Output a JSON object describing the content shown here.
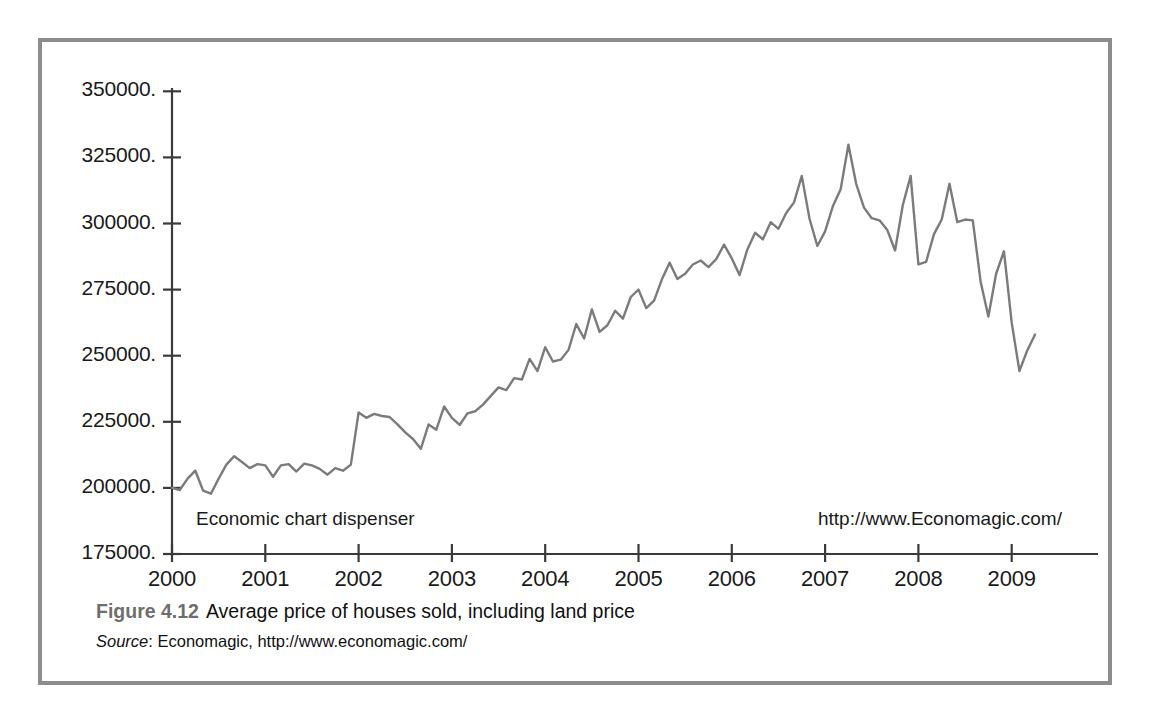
{
  "figure": {
    "caption_figure_number": "Figure 4.12",
    "caption_title": "Average price of houses sold, including land price",
    "source_label": "Source",
    "source_text": ": Economagic, http://www.economagic.com/"
  },
  "annotations": {
    "left": "Economic chart dispenser",
    "right": "http://www.Economagic.com/"
  },
  "colors": {
    "line": "#7b7b7b",
    "axis": "#3a3a3a",
    "frame": "#8d8d8d",
    "text": "#1a1a1a",
    "caption_number": "#6e6e6e"
  },
  "chart_data": {
    "type": "line",
    "title": "Average price of houses sold, including land price",
    "xlabel": "",
    "ylabel": "",
    "xlim": [
      2000.0,
      2009.75
    ],
    "ylim": [
      175000,
      350000
    ],
    "grid": false,
    "legend": "none",
    "x_tick_labels": [
      "2000",
      "2001",
      "2002",
      "2003",
      "2004",
      "2005",
      "2006",
      "2007",
      "2008",
      "2009"
    ],
    "x_tick_values": [
      2000,
      2001,
      2002,
      2003,
      2004,
      2005,
      2006,
      2007,
      2008,
      2009
    ],
    "y_tick_labels": [
      "175000.",
      "200000.",
      "225000.",
      "250000.",
      "275000.",
      "300000.",
      "325000.",
      "350000."
    ],
    "y_tick_values": [
      175000,
      200000,
      225000,
      250000,
      275000,
      300000,
      325000,
      350000
    ],
    "series": [
      {
        "name": "Average price of houses sold",
        "x": [
          2000.0,
          2000.083,
          2000.167,
          2000.25,
          2000.333,
          2000.417,
          2000.5,
          2000.583,
          2000.667,
          2000.75,
          2000.833,
          2000.917,
          2001.0,
          2001.083,
          2001.167,
          2001.25,
          2001.333,
          2001.417,
          2001.5,
          2001.583,
          2001.667,
          2001.75,
          2001.833,
          2001.917,
          2002.0,
          2002.083,
          2002.167,
          2002.25,
          2002.333,
          2002.417,
          2002.5,
          2002.583,
          2002.667,
          2002.75,
          2002.833,
          2002.917,
          2003.0,
          2003.083,
          2003.167,
          2003.25,
          2003.333,
          2003.417,
          2003.5,
          2003.583,
          2003.667,
          2003.75,
          2003.833,
          2003.917,
          2004.0,
          2004.083,
          2004.167,
          2004.25,
          2004.333,
          2004.417,
          2004.5,
          2004.583,
          2004.667,
          2004.75,
          2004.833,
          2004.917,
          2005.0,
          2005.083,
          2005.167,
          2005.25,
          2005.333,
          2005.417,
          2005.5,
          2005.583,
          2005.667,
          2005.75,
          2005.833,
          2005.917,
          2006.0,
          2006.083,
          2006.167,
          2006.25,
          2006.333,
          2006.417,
          2006.5,
          2006.583,
          2006.667,
          2006.75,
          2006.833,
          2006.917,
          2007.0,
          2007.083,
          2007.167,
          2007.25,
          2007.333,
          2007.417,
          2007.5,
          2007.583,
          2007.667,
          2007.75,
          2007.833,
          2007.917,
          2008.0,
          2008.083,
          2008.167,
          2008.25,
          2008.333,
          2008.417,
          2008.5,
          2008.583,
          2008.667,
          2008.75,
          2008.833,
          2008.917,
          2009.0,
          2009.083,
          2009.167,
          2009.25
        ],
        "y": [
          200000,
          199200,
          203500,
          206500,
          199000,
          197800,
          203500,
          208800,
          212000,
          209800,
          207500,
          209000,
          208500,
          204200,
          208500,
          209000,
          206200,
          209200,
          208500,
          207200,
          205000,
          207500,
          206500,
          208800,
          228500,
          226500,
          228000,
          227200,
          226800,
          224000,
          221000,
          218500,
          214800,
          224000,
          222000,
          230800,
          226500,
          223800,
          228200,
          229000,
          231500,
          234800,
          238000,
          237000,
          241500,
          241000,
          248800,
          244200,
          253200,
          247800,
          248500,
          252200,
          262000,
          256500,
          267500,
          259000,
          261500,
          267000,
          264000,
          272200,
          275000,
          268000,
          270800,
          278800,
          285200,
          279000,
          281000,
          284500,
          286000,
          283500,
          286500,
          292000,
          286800,
          280500,
          290200,
          296500,
          294000,
          300500,
          298000,
          304000,
          308000,
          318000,
          301800,
          291500,
          297000,
          306500,
          313000,
          329800,
          315000,
          306000,
          302000,
          301200,
          297500,
          289800,
          307000,
          318000,
          284500,
          285500,
          296000,
          301500,
          315000,
          300500,
          301500,
          301200,
          278000,
          264800,
          281000,
          289500,
          262500,
          244200,
          252000,
          258000
        ]
      }
    ]
  }
}
